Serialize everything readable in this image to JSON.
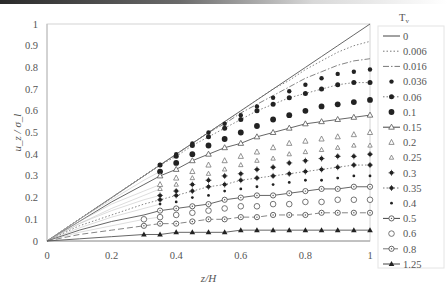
{
  "chart_data": {
    "type": "line",
    "title": "",
    "xlabel": "z/H",
    "ylabel": "u_z / σ_l",
    "xlim": [
      0,
      1
    ],
    "ylim": [
      0,
      1
    ],
    "xticks": [
      "0",
      "0.2",
      "0.4",
      "0.6",
      "0.8",
      "1"
    ],
    "yticks": [
      "0",
      "0.1",
      "0.2",
      "0.3",
      "0.4",
      "0.5",
      "0.6",
      "0.7",
      "0.8",
      "0.9",
      "1"
    ],
    "grid": false,
    "legend_title": "T_v",
    "legend_position": "right",
    "x": [
      0,
      0.1,
      0.2,
      0.3,
      0.35,
      0.4,
      0.45,
      0.5,
      0.55,
      0.6,
      0.65,
      0.7,
      0.75,
      0.8,
      0.85,
      0.9,
      0.95,
      1.0
    ],
    "series": [
      {
        "name": "0",
        "style": "solid",
        "marker": "none",
        "values": [
          0,
          0.1,
          0.2,
          0.3,
          0.35,
          0.4,
          0.45,
          0.5,
          0.55,
          0.6,
          0.65,
          0.7,
          0.75,
          0.8,
          0.85,
          0.9,
          0.95,
          1.0
        ]
      },
      {
        "name": "0.006",
        "style": "dotted",
        "marker": "none",
        "values": [
          0,
          0.1,
          0.2,
          0.3,
          0.35,
          0.4,
          0.45,
          0.5,
          0.55,
          0.6,
          0.65,
          0.7,
          0.74,
          0.79,
          0.83,
          0.87,
          0.9,
          0.92
        ]
      },
      {
        "name": "0.016",
        "style": "dashdot",
        "marker": "none",
        "values": [
          0,
          0.1,
          0.2,
          0.3,
          0.35,
          0.4,
          0.45,
          0.5,
          0.54,
          0.59,
          0.63,
          0.67,
          0.71,
          0.75,
          0.78,
          0.81,
          0.83,
          0.84
        ]
      },
      {
        "name": "0.036",
        "style": "none",
        "marker": "filled-circle-small",
        "values": [
          0,
          0.1,
          0.2,
          0.3,
          0.35,
          0.4,
          0.45,
          0.5,
          0.54,
          0.58,
          0.62,
          0.66,
          0.69,
          0.72,
          0.75,
          0.77,
          0.78,
          0.79
        ]
      },
      {
        "name": "0.06",
        "style": "dotted",
        "marker": "filled-circle",
        "values": [
          0,
          0.1,
          0.2,
          0.3,
          0.35,
          0.39,
          0.44,
          0.48,
          0.52,
          0.56,
          0.6,
          0.63,
          0.66,
          0.68,
          0.7,
          0.72,
          0.73,
          0.73
        ]
      },
      {
        "name": "0.1",
        "style": "none",
        "marker": "filled-circle-large",
        "values": [
          0,
          0.1,
          0.19,
          0.28,
          0.32,
          0.36,
          0.4,
          0.44,
          0.47,
          0.5,
          0.53,
          0.56,
          0.58,
          0.6,
          0.62,
          0.63,
          0.64,
          0.65
        ]
      },
      {
        "name": "0.15",
        "style": "solid",
        "marker": "open-triangle",
        "values": [
          0,
          0.09,
          0.18,
          0.26,
          0.3,
          0.33,
          0.37,
          0.4,
          0.43,
          0.45,
          0.48,
          0.5,
          0.52,
          0.54,
          0.55,
          0.56,
          0.57,
          0.58
        ]
      },
      {
        "name": "0.2",
        "style": "none",
        "marker": "open-triangle-small",
        "values": [
          0,
          0.09,
          0.17,
          0.23,
          0.26,
          0.29,
          0.32,
          0.35,
          0.37,
          0.39,
          0.41,
          0.43,
          0.45,
          0.46,
          0.47,
          0.48,
          0.49,
          0.5
        ]
      },
      {
        "name": "0.25",
        "style": "none",
        "marker": "open-triangle-tiny",
        "values": [
          0,
          0.08,
          0.15,
          0.21,
          0.24,
          0.26,
          0.29,
          0.31,
          0.33,
          0.35,
          0.37,
          0.38,
          0.4,
          0.41,
          0.42,
          0.43,
          0.44,
          0.44
        ]
      },
      {
        "name": "0.3",
        "style": "none",
        "marker": "filled-star",
        "values": [
          0,
          0.08,
          0.14,
          0.19,
          0.21,
          0.23,
          0.26,
          0.28,
          0.3,
          0.31,
          0.33,
          0.34,
          0.36,
          0.37,
          0.38,
          0.39,
          0.39,
          0.4
        ]
      },
      {
        "name": "0.35",
        "style": "dotted",
        "marker": "filled-star",
        "values": [
          0,
          0.07,
          0.12,
          0.17,
          0.19,
          0.21,
          0.23,
          0.25,
          0.26,
          0.28,
          0.29,
          0.3,
          0.31,
          0.32,
          0.33,
          0.34,
          0.35,
          0.35
        ]
      },
      {
        "name": "0.4",
        "style": "none",
        "marker": "small-dot",
        "values": [
          0,
          0.06,
          0.11,
          0.15,
          0.17,
          0.18,
          0.2,
          0.21,
          0.23,
          0.24,
          0.25,
          0.26,
          0.27,
          0.28,
          0.28,
          0.29,
          0.3,
          0.3
        ]
      },
      {
        "name": "0.5",
        "style": "solid",
        "marker": "open-circle-dot",
        "values": [
          0,
          0.05,
          0.09,
          0.12,
          0.14,
          0.15,
          0.16,
          0.17,
          0.19,
          0.2,
          0.21,
          0.21,
          0.22,
          0.23,
          0.24,
          0.24,
          0.25,
          0.25
        ]
      },
      {
        "name": "0.6",
        "style": "none",
        "marker": "open-circle",
        "values": [
          0,
          0.04,
          0.07,
          0.1,
          0.11,
          0.12,
          0.13,
          0.14,
          0.15,
          0.16,
          0.16,
          0.17,
          0.17,
          0.18,
          0.18,
          0.19,
          0.19,
          0.19
        ]
      },
      {
        "name": "0.8",
        "style": "dashed",
        "marker": "open-circle-dot",
        "values": [
          0,
          0.03,
          0.05,
          0.07,
          0.08,
          0.08,
          0.09,
          0.1,
          0.1,
          0.11,
          0.11,
          0.12,
          0.12,
          0.12,
          0.13,
          0.13,
          0.13,
          0.13
        ]
      },
      {
        "name": "1.25",
        "style": "solid",
        "marker": "filled-triangle",
        "values": [
          0,
          0.01,
          0.02,
          0.03,
          0.03,
          0.04,
          0.04,
          0.04,
          0.04,
          0.05,
          0.05,
          0.05,
          0.05,
          0.05,
          0.05,
          0.05,
          0.05,
          0.05
        ]
      }
    ]
  }
}
